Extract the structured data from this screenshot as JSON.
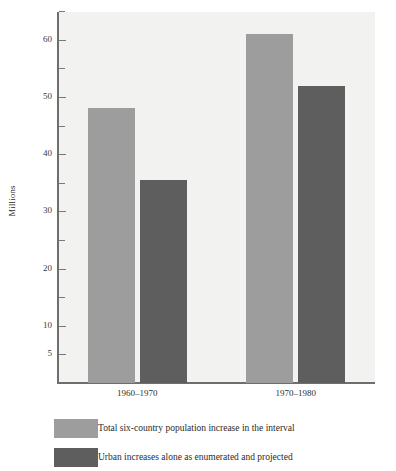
{
  "chart_data": {
    "type": "bar",
    "title": "",
    "xlabel": "",
    "ylabel": "Millions",
    "ylim": [
      0,
      65
    ],
    "grid": false,
    "legend_position": "bottom-left",
    "categories": [
      "1960–1970",
      "1970–1980"
    ],
    "series": [
      {
        "name": "Total six-country population increase in the interval",
        "color": "#9d9d9d",
        "values": [
          48,
          61
        ]
      },
      {
        "name": "Urban increases alone as enumerated and projected",
        "color": "#5e5e5e",
        "values": [
          35.5,
          52
        ]
      }
    ],
    "y_ticks_major": [
      5,
      10,
      20,
      30,
      40,
      50,
      60
    ],
    "y_ticks_major_labels": [
      "5",
      "10",
      "20",
      "30",
      "40",
      "50",
      "60"
    ],
    "y_ticks_minor": [
      15,
      25,
      35,
      45,
      55,
      65
    ],
    "plot_background": "#f2f2f0",
    "axis_color": "#6e6e6e"
  },
  "axis": {
    "y_title": "Millions"
  },
  "legend": {
    "items": [
      {
        "label": "Total six-country population increase in the interval"
      },
      {
        "label": "Urban increases alone as enumerated and projected"
      }
    ]
  }
}
